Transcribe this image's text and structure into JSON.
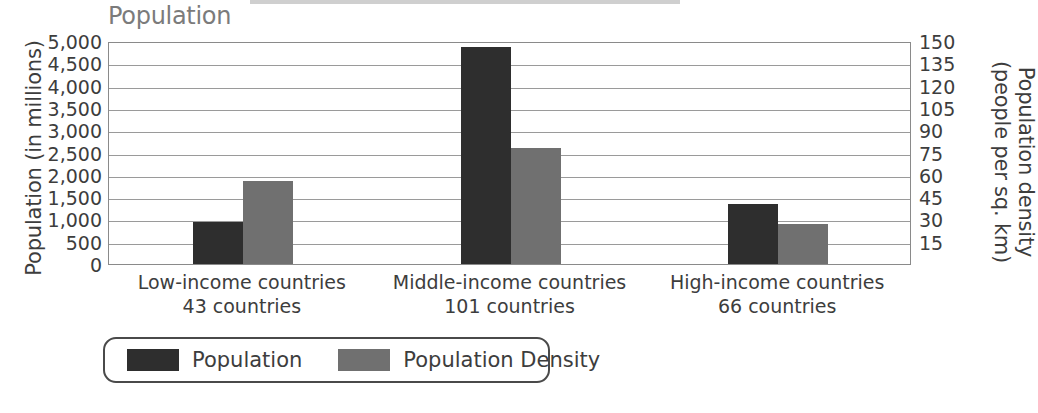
{
  "chart_data": {
    "type": "bar",
    "title": "Population",
    "categories": [
      "Low-income countries",
      "Middle-income countries",
      "High-income countries"
    ],
    "category_sublabels": [
      "43 countries",
      "101 countries",
      "66 countries"
    ],
    "series": [
      {
        "name": "Population",
        "axis": "left",
        "color": "#2e2e2e",
        "values": [
          940,
          4870,
          1345
        ]
      },
      {
        "name": "Population Density",
        "axis": "right",
        "color": "#707070",
        "values": [
          56,
          78,
          27
        ]
      }
    ],
    "left_axis": {
      "label": "Population (in millions)",
      "ticks": [
        "5,000",
        "4,500",
        "4,000",
        "3,500",
        "3,000",
        "2,500",
        "2,000",
        "1,500",
        "1,000",
        "500",
        "0"
      ],
      "min": 0,
      "max": 5000
    },
    "right_axis": {
      "label_line1": "Population density",
      "label_line2": "(people per sq. km)",
      "ticks": [
        "150",
        "135",
        "120",
        "105",
        "90",
        "75",
        "60",
        "45",
        "30",
        "15"
      ],
      "min": 0,
      "max": 150
    },
    "grid": true,
    "legend_position": "bottom-left",
    "xlabel": "",
    "ylabel": "Population (in millions)"
  }
}
